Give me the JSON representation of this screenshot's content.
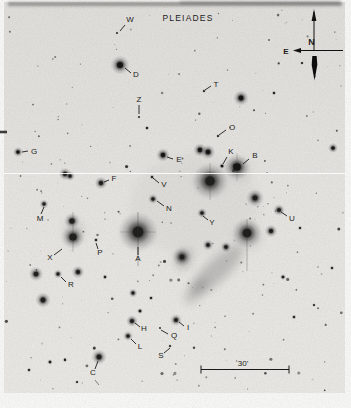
{
  "figure": {
    "title": "PLEIADES",
    "kind": "annotated negative photographic plate of the Pleiades star cluster"
  },
  "compass": {
    "north": "N",
    "east": "E"
  },
  "scale_bar": {
    "label": "30'"
  },
  "plate": {
    "background": "#e8e6e2",
    "ink": "#1b1b1b",
    "seam_y": 173.5
  },
  "annotations": [
    {
      "l": "W",
      "tx": 130,
      "ty": 22,
      "x1": 125,
      "y1": 25,
      "x2": 120,
      "y2": 31
    },
    {
      "l": "D",
      "tx": 136,
      "ty": 77,
      "x1": 131,
      "y1": 73,
      "x2": 125,
      "y2": 68
    },
    {
      "l": "T",
      "tx": 216,
      "ty": 87,
      "x1": 211,
      "y1": 86,
      "x2": 205,
      "y2": 90
    },
    {
      "l": "Z",
      "tx": 139,
      "ty": 102,
      "x1": 139,
      "y1": 105,
      "x2": 139,
      "y2": 114
    },
    {
      "l": "O",
      "tx": 232,
      "ty": 130,
      "x1": 226,
      "y1": 130,
      "x2": 219,
      "y2": 135
    },
    {
      "l": "G",
      "tx": 34,
      "ty": 154,
      "x1": 28,
      "y1": 151,
      "x2": 22,
      "y2": 152
    },
    {
      "l": "E",
      "tx": 179,
      "ty": 162,
      "x1": 173,
      "y1": 159,
      "x2": 167,
      "y2": 157
    },
    {
      "l": "K",
      "tx": 231,
      "ty": 154,
      "x1": 227,
      "y1": 157,
      "x2": 223,
      "y2": 164
    },
    {
      "l": "B",
      "tx": 255,
      "ty": 158,
      "x1": 249,
      "y1": 159,
      "x2": 243,
      "y2": 164
    },
    {
      "l": "F",
      "tx": 114,
      "ty": 181,
      "x1": 109,
      "y1": 180,
      "x2": 104,
      "y2": 182
    },
    {
      "l": "V",
      "tx": 164,
      "ty": 187,
      "x1": 159,
      "y1": 183,
      "x2": 153,
      "y2": 178
    },
    {
      "l": "M",
      "tx": 40,
      "ty": 221,
      "x1": 41,
      "y1": 214,
      "x2": 44,
      "y2": 207
    },
    {
      "l": "N",
      "tx": 169,
      "ty": 211,
      "x1": 164,
      "y1": 206,
      "x2": 157,
      "y2": 201
    },
    {
      "l": "U",
      "tx": 292,
      "ty": 221,
      "x1": 287,
      "y1": 216,
      "x2": 281,
      "y2": 212
    },
    {
      "l": "Y",
      "tx": 212,
      "ty": 225,
      "x1": 208,
      "y1": 220,
      "x2": 203,
      "y2": 216
    },
    {
      "l": "X",
      "tx": 50,
      "ty": 260,
      "x1": 54,
      "y1": 255,
      "x2": 62,
      "y2": 249
    },
    {
      "l": "P",
      "tx": 100,
      "ty": 255,
      "x1": 98,
      "y1": 249,
      "x2": 96,
      "y2": 243
    },
    {
      "l": "A",
      "tx": 138,
      "ty": 261,
      "x1": 138,
      "y1": 255,
      "x2": 138,
      "y2": 247
    },
    {
      "l": "R",
      "tx": 71,
      "ty": 287,
      "x1": 66,
      "y1": 282,
      "x2": 61,
      "y2": 277
    },
    {
      "l": "H",
      "tx": 144,
      "ty": 331,
      "x1": 140,
      "y1": 327,
      "x2": 135,
      "y2": 323
    },
    {
      "l": "I",
      "tx": 188,
      "ty": 330,
      "x1": 184,
      "y1": 326,
      "x2": 179,
      "y2": 322
    },
    {
      "l": "Q",
      "tx": 174,
      "ty": 338,
      "x1": 168,
      "y1": 334,
      "x2": 161,
      "y2": 330
    },
    {
      "l": "L",
      "tx": 140,
      "ty": 349,
      "x1": 136,
      "y1": 344,
      "x2": 131,
      "y2": 339
    },
    {
      "l": "S",
      "tx": 161,
      "ty": 358,
      "x1": 164,
      "y1": 353,
      "x2": 170,
      "y2": 348
    },
    {
      "l": "C",
      "tx": 93,
      "ty": 375,
      "x1": 95,
      "y1": 369,
      "x2": 98,
      "y2": 361
    }
  ],
  "stars": [
    {
      "x": 120,
      "y": 65,
      "r": 4.2
    },
    {
      "x": 117,
      "y": 33,
      "r": 1
    },
    {
      "x": 139,
      "y": 117,
      "r": 1
    },
    {
      "x": 204,
      "y": 91,
      "r": 1.2
    },
    {
      "x": 241,
      "y": 98,
      "r": 3.4
    },
    {
      "x": 274,
      "y": 93,
      "r": 1.4
    },
    {
      "x": 218,
      "y": 136,
      "r": 1.2
    },
    {
      "x": 147,
      "y": 128,
      "r": 1.4
    },
    {
      "x": 333,
      "y": 148,
      "r": 2.2
    },
    {
      "x": 18,
      "y": 152,
      "r": 2.2
    },
    {
      "x": 163,
      "y": 155,
      "r": 3
    },
    {
      "x": 200,
      "y": 150,
      "r": 3
    },
    {
      "x": 208,
      "y": 152,
      "r": 3.2
    },
    {
      "x": 222,
      "y": 166,
      "r": 1.8
    },
    {
      "x": 237,
      "y": 167,
      "r": 5.2,
      "halo": 13
    },
    {
      "x": 65,
      "y": 174,
      "r": 2.8
    },
    {
      "x": 70,
      "y": 176,
      "r": 2.2
    },
    {
      "x": 101,
      "y": 183,
      "r": 2.8
    },
    {
      "x": 152,
      "y": 177,
      "r": 1.5
    },
    {
      "x": 210,
      "y": 181,
      "r": 6.5,
      "halo": 18
    },
    {
      "x": 255,
      "y": 198,
      "r": 3.4,
      "halo": 9
    },
    {
      "x": 153,
      "y": 199,
      "r": 2.2
    },
    {
      "x": 44,
      "y": 204,
      "r": 2
    },
    {
      "x": 279,
      "y": 210,
      "r": 2.6
    },
    {
      "x": 202,
      "y": 213,
      "r": 2.2
    },
    {
      "x": 72,
      "y": 221,
      "r": 3.6,
      "halo": 8
    },
    {
      "x": 73,
      "y": 237,
      "r": 5,
      "halo": 12
    },
    {
      "x": 138,
      "y": 232,
      "r": 7.5,
      "halo": 20
    },
    {
      "x": 96,
      "y": 240,
      "r": 1.5
    },
    {
      "x": 271,
      "y": 231,
      "r": 2.8
    },
    {
      "x": 247,
      "y": 233,
      "r": 6,
      "halo": 15
    },
    {
      "x": 226,
      "y": 247,
      "r": 2.4
    },
    {
      "x": 208,
      "y": 245,
      "r": 2.4
    },
    {
      "x": 182,
      "y": 257,
      "r": 3.2,
      "halo": 10
    },
    {
      "x": 300,
      "y": 228,
      "r": 1.4
    },
    {
      "x": 332,
      "y": 268,
      "r": 1.4
    },
    {
      "x": 283,
      "y": 277,
      "r": 1.8
    },
    {
      "x": 36,
      "y": 274,
      "r": 3.2
    },
    {
      "x": 58,
      "y": 274,
      "r": 2
    },
    {
      "x": 78,
      "y": 272,
      "r": 2.8
    },
    {
      "x": 105,
      "y": 277,
      "r": 1.6
    },
    {
      "x": 43,
      "y": 300,
      "r": 3.4
    },
    {
      "x": 133,
      "y": 293,
      "r": 2
    },
    {
      "x": 151,
      "y": 298,
      "r": 1.5
    },
    {
      "x": 140,
      "y": 311,
      "r": 1.8
    },
    {
      "x": 132,
      "y": 321,
      "r": 2.6
    },
    {
      "x": 176,
      "y": 320,
      "r": 2.6
    },
    {
      "x": 160,
      "y": 328,
      "r": 1
    },
    {
      "x": 128,
      "y": 336,
      "r": 2.2
    },
    {
      "x": 170,
      "y": 346,
      "r": 1.2
    },
    {
      "x": 99,
      "y": 357,
      "r": 3.4
    },
    {
      "x": 294,
      "y": 317,
      "r": 1.5
    },
    {
      "x": 314,
      "y": 305,
      "r": 1.2
    },
    {
      "x": 29,
      "y": 370,
      "r": 1.4
    },
    {
      "x": 50,
      "y": 362,
      "r": 1.7
    },
    {
      "x": 65,
      "y": 360,
      "r": 1.4
    },
    {
      "x": 77,
      "y": 382,
      "r": 1.2
    },
    {
      "x": 302,
      "y": 63,
      "r": 1.2
    }
  ],
  "nebulae": [
    {
      "cx": 217,
      "cy": 270,
      "rx": 34,
      "ry": 11,
      "rot": 137,
      "op": 0.28
    },
    {
      "cx": 196,
      "cy": 291,
      "rx": 16,
      "ry": 7,
      "rot": 130,
      "op": 0.22
    },
    {
      "cx": 184,
      "cy": 259,
      "rx": 11,
      "ry": 8,
      "rot": 120,
      "op": 0.26
    },
    {
      "cx": 210,
      "cy": 182,
      "rx": 15,
      "ry": 12,
      "rot": 0,
      "op": 0.16
    },
    {
      "cx": 239,
      "cy": 170,
      "rx": 12,
      "ry": 10,
      "rot": 0,
      "op": 0.13
    },
    {
      "cx": 138,
      "cy": 233,
      "rx": 15,
      "ry": 13,
      "rot": 0,
      "op": 0.13
    },
    {
      "cx": 74,
      "cy": 231,
      "rx": 10,
      "ry": 12,
      "rot": 0,
      "op": 0.12
    },
    {
      "cx": 248,
      "cy": 237,
      "rx": 13,
      "ry": 11,
      "rot": 0,
      "op": 0.18
    },
    {
      "cx": 195,
      "cy": 205,
      "rx": 65,
      "ry": 50,
      "rot": 0,
      "op": 0.045
    }
  ],
  "spikes": [
    {
      "x1": 138,
      "y1": 212,
      "x2": 138,
      "y2": 266,
      "op": 0.4
    },
    {
      "x1": 120,
      "y1": 232,
      "x2": 156,
      "y2": 232,
      "op": 0.22
    },
    {
      "x1": 247,
      "y1": 219,
      "x2": 247,
      "y2": 271,
      "op": 0.32
    },
    {
      "x1": 210,
      "y1": 163,
      "x2": 210,
      "y2": 200,
      "op": 0.25
    },
    {
      "x1": 73,
      "y1": 212,
      "x2": 73,
      "y2": 252,
      "op": 0.28
    },
    {
      "x1": 237,
      "y1": 153,
      "x2": 237,
      "y2": 181,
      "op": 0.22
    }
  ],
  "marks": [
    {
      "x1": 0,
      "y1": 132,
      "x2": 7,
      "y2": 132,
      "w": 2.6,
      "op": 0.8
    },
    {
      "x1": 95,
      "y1": 380,
      "x2": 99,
      "y2": 385,
      "w": 0.9,
      "op": 0.55
    }
  ],
  "field": {
    "seed": 7,
    "faint_stars": 150,
    "small_stars": 45
  }
}
